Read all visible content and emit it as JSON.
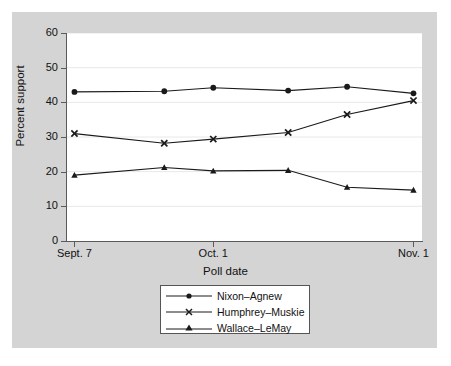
{
  "chart_data": {
    "type": "line",
    "title": "",
    "xlabel": "Poll date",
    "ylabel": "Percent support",
    "ylim": [
      0,
      60
    ],
    "yticks": [
      0,
      10,
      20,
      30,
      40,
      50,
      60
    ],
    "ytick_labels": [
      "0",
      "10",
      "20",
      "30",
      "40",
      "50",
      "60"
    ],
    "x": [
      1,
      2,
      3,
      4,
      5,
      6
    ],
    "xtick_positions": [
      1,
      3,
      6
    ],
    "xtick_labels": [
      "Sept. 7",
      "Oct. 1",
      "Nov. 1"
    ],
    "grid": "horizontal",
    "legend_position": "below-axis",
    "series": [
      {
        "name": "Nixon–Agnew",
        "marker": "filled-circle",
        "values": [
          43.0,
          43.2,
          44.2,
          43.4,
          44.5,
          42.6
        ]
      },
      {
        "name": "Humphrey–Muskie",
        "marker": "x-cross",
        "values": [
          31.0,
          28.2,
          29.4,
          31.3,
          36.5,
          40.5
        ]
      },
      {
        "name": "Wallace–LeMay",
        "marker": "filled-triangle",
        "values": [
          19.0,
          21.2,
          20.2,
          20.4,
          15.5,
          14.7
        ]
      }
    ],
    "colors": {
      "line": "#1a1a1a",
      "plot_background": "#ffffff",
      "figure_background": "#d4d4d4",
      "gridline": "#e8e8e8",
      "axis": "#5a5a5a"
    }
  },
  "legend": {
    "entries": [
      {
        "label": "Nixon–Agnew"
      },
      {
        "label": "Humphrey–Muskie"
      },
      {
        "label": "Wallace–LeMay"
      }
    ]
  }
}
